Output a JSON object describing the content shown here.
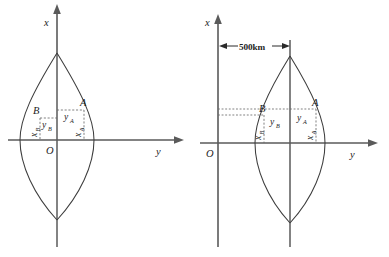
{
  "figure": {
    "type": "geometry-diagram",
    "panels": [
      {
        "id": "left",
        "name": "left-diagram",
        "axes": {
          "vertical_axis_label": "x",
          "horizontal_axis_label": "y",
          "origin_label": "O"
        },
        "points": [
          {
            "label": "A",
            "x_label": "x",
            "x_sub": "A",
            "y_label": "y",
            "y_sub": "A"
          },
          {
            "label": "B",
            "x_label": "x",
            "x_sub": "B",
            "y_label": "y",
            "y_sub": "B"
          }
        ],
        "annotations": []
      },
      {
        "id": "right",
        "name": "right-diagram",
        "axes": {
          "vertical_axis_label": "x",
          "horizontal_axis_label": "y",
          "origin_label": "O"
        },
        "points": [
          {
            "label": "A",
            "x_label": "x",
            "x_sub": "A",
            "y_label": "y",
            "y_sub": "A"
          },
          {
            "label": "B",
            "x_label": "x",
            "x_sub": "B",
            "y_label": "y",
            "y_sub": "B"
          }
        ],
        "annotations": [
          {
            "name": "offset-dimension",
            "text": "500km"
          }
        ]
      }
    ],
    "colors": {
      "axis": "#5a5a5a",
      "curve": "#3d3d3d",
      "guide": "#6b6b6b",
      "text": "#1d1d1d",
      "background": "#ffffff"
    }
  }
}
